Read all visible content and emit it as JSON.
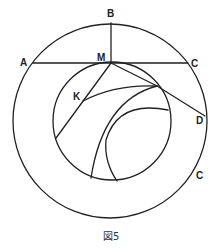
{
  "figure": {
    "caption": "図5",
    "colors": {
      "stroke": "#222222",
      "background": "#ffffff"
    },
    "labels": {
      "A": "A",
      "B": "B",
      "C_top": "C",
      "M": "M",
      "K": "K",
      "D": "D",
      "C_bottom": "C"
    },
    "circles": [
      {
        "name": "outer-circle",
        "cx": 110,
        "cy": 121,
        "r": 97
      },
      {
        "name": "inner-circle",
        "cx": 112,
        "cy": 121,
        "r": 59
      }
    ],
    "points": {
      "A": [
        33,
        63
      ],
      "B": [
        111,
        23
      ],
      "C": [
        188,
        63
      ],
      "M": [
        111,
        63
      ],
      "K": [
        83,
        101
      ],
      "D": [
        205,
        116
      ]
    }
  }
}
